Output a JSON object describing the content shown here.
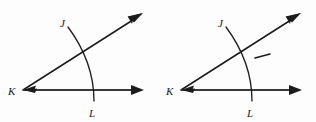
{
  "document": {
    "title": "Angle JKL construction figures",
    "background_color": "#fdfdfd",
    "ink_color": "#1b1b1b",
    "figure_count": 2
  },
  "figures": [
    {
      "id": "figure-left",
      "name": "angle-jkl-plain",
      "caption": "",
      "vertex_label": "K",
      "ray_upper_label": "J",
      "ray_lower_label": "L",
      "has_tick_mark": false,
      "tick_label": ""
    },
    {
      "id": "figure-right",
      "name": "angle-jkl-with-tick",
      "caption": "",
      "vertex_label": "K",
      "ray_upper_label": "J",
      "ray_lower_label": "L",
      "has_tick_mark": true,
      "tick_label": ""
    }
  ],
  "geometry": {
    "vertex": {
      "x": 23,
      "y": 90
    },
    "ray_upper_end": {
      "x": 142,
      "y": 14
    },
    "ray_lower_end": {
      "x": 143,
      "y": 90
    },
    "arc_start": {
      "x": 68,
      "y": 27
    },
    "arc_end": {
      "x": 94,
      "y": 101
    },
    "arc_control": {
      "x": 93,
      "y": 63
    },
    "label_j": {
      "x": 62,
      "y": 25
    },
    "label_k": {
      "x": 10,
      "y": 94
    },
    "label_l": {
      "x": 91,
      "y": 116
    },
    "tick": {
      "x1": 95,
      "y1": 58,
      "x2": 110,
      "y2": 54
    }
  }
}
